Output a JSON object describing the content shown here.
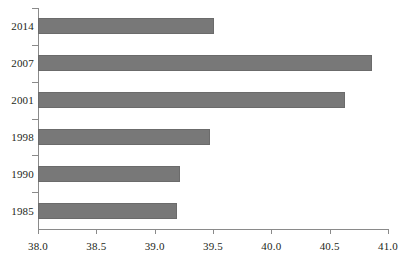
{
  "chart_data": {
    "type": "bar",
    "orientation": "horizontal",
    "title": "",
    "subtitle": "",
    "xlabel": "",
    "ylabel": "",
    "categories": [
      "2014",
      "2007",
      "2001",
      "1998",
      "1990",
      "1985"
    ],
    "values": [
      39.51,
      40.86,
      40.63,
      39.47,
      39.22,
      39.19
    ],
    "series": [
      {
        "name": "",
        "values": [
          39.51,
          40.86,
          40.63,
          39.47,
          39.22,
          39.19
        ]
      }
    ],
    "xlim": [
      38.0,
      41.0
    ],
    "xticks": [
      38.0,
      38.5,
      39.0,
      39.5,
      40.0,
      40.5,
      41.0
    ],
    "xticklabels": [
      "38.0",
      "38.5",
      "39.0",
      "39.5",
      "40.0",
      "40.5",
      "41.0"
    ],
    "grid": false,
    "legend": false,
    "legend_position": "none",
    "bar_color": "#787878",
    "bar_edge_color": "#6b6b6b",
    "axis_color": "#8a8a8a",
    "background_color": "#ffffff",
    "text_color": "#231f20"
  }
}
